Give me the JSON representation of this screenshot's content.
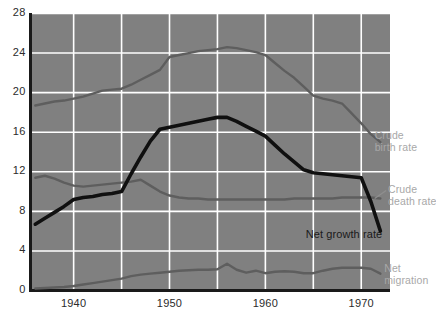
{
  "chart_data": {
    "type": "line",
    "title": "",
    "xlabel": "",
    "ylabel": "",
    "xlim": [
      1935.5,
      1973.0
    ],
    "ylim": [
      0,
      28
    ],
    "grid": true,
    "legend_position": "inline-right-of-lines",
    "x_ticks": [
      "1940",
      "1950",
      "1960",
      "1970"
    ],
    "x_tick_values": [
      1940,
      1950,
      1960,
      1970
    ],
    "x_gridlines": [
      1940,
      1945,
      1950,
      1955,
      1960,
      1965,
      1970
    ],
    "y_ticks": [
      "0",
      "4",
      "8",
      "12",
      "16",
      "20",
      "24",
      "28"
    ],
    "y_tick_values": [
      0,
      4,
      8,
      12,
      16,
      20,
      24,
      28
    ],
    "background_color": "#808080",
    "gridline_color": "#ffffff",
    "axis_color": "#1a1a1a",
    "series": [
      {
        "name": "Crude birth rate",
        "color": "#5e5e5e",
        "width": 2.4,
        "label_position": "right",
        "x": [
          1936,
          1937,
          1938,
          1939,
          1940,
          1941,
          1942,
          1943,
          1944,
          1945,
          1946,
          1947,
          1948,
          1949,
          1950,
          1951,
          1952,
          1953,
          1954,
          1955,
          1956,
          1957,
          1958,
          1959,
          1960,
          1961,
          1962,
          1963,
          1964,
          1965,
          1966,
          1967,
          1968,
          1969,
          1970,
          1971,
          1972
        ],
        "values": [
          18.7,
          18.9,
          19.1,
          19.2,
          19.4,
          19.6,
          19.9,
          20.2,
          20.3,
          20.4,
          20.8,
          21.3,
          21.8,
          22.3,
          23.6,
          23.8,
          24.0,
          24.2,
          24.3,
          24.4,
          24.6,
          24.5,
          24.3,
          24.1,
          23.8,
          23.0,
          22.2,
          21.5,
          20.6,
          19.7,
          19.4,
          19.2,
          18.9,
          17.9,
          16.9,
          15.8,
          15.0
        ],
        "start_value": 18.7,
        "peak_value": 24.6,
        "peak_x": 1956,
        "end_value": 15.0
      },
      {
        "name": "Crude death rate",
        "color": "#5e5e5e",
        "width": 2.4,
        "label_position": "right",
        "x": [
          1936,
          1937,
          1938,
          1939,
          1940,
          1941,
          1942,
          1943,
          1944,
          1945,
          1946,
          1947,
          1948,
          1949,
          1950,
          1951,
          1952,
          1953,
          1954,
          1955,
          1956,
          1957,
          1958,
          1959,
          1960,
          1961,
          1962,
          1963,
          1964,
          1965,
          1966,
          1967,
          1968,
          1969,
          1970,
          1971,
          1972
        ],
        "values": [
          11.4,
          11.6,
          11.3,
          10.9,
          10.6,
          10.5,
          10.6,
          10.7,
          10.8,
          10.9,
          11.0,
          11.2,
          10.6,
          10.0,
          9.6,
          9.4,
          9.3,
          9.3,
          9.2,
          9.2,
          9.2,
          9.2,
          9.2,
          9.2,
          9.2,
          9.2,
          9.2,
          9.3,
          9.3,
          9.3,
          9.3,
          9.3,
          9.4,
          9.4,
          9.4,
          9.4,
          9.3
        ],
        "start_value": 11.4,
        "end_value": 9.3
      },
      {
        "name": "Net growth rate",
        "color": "#101010",
        "width": 3.6,
        "label_position": "below-right",
        "x": [
          1936,
          1937,
          1938,
          1939,
          1940,
          1941,
          1942,
          1943,
          1944,
          1945,
          1946,
          1947,
          1948,
          1949,
          1950,
          1951,
          1952,
          1953,
          1954,
          1955,
          1956,
          1957,
          1958,
          1959,
          1960,
          1961,
          1962,
          1963,
          1964,
          1965,
          1966,
          1967,
          1968,
          1969,
          1970,
          1971,
          1972
        ],
        "values": [
          6.7,
          7.3,
          7.9,
          8.5,
          9.2,
          9.4,
          9.5,
          9.7,
          9.8,
          10.0,
          11.8,
          13.5,
          15.1,
          16.3,
          16.5,
          16.7,
          16.9,
          17.1,
          17.3,
          17.5,
          17.5,
          17.1,
          16.6,
          16.1,
          15.6,
          14.7,
          13.8,
          13.0,
          12.2,
          11.9,
          11.8,
          11.7,
          11.6,
          11.5,
          11.4,
          9.0,
          6.0
        ],
        "start_value": 6.7,
        "peak_value": 17.5,
        "peak_x": 1956,
        "end_value": 6.0
      },
      {
        "name": "Net migration",
        "color": "#5e5e5e",
        "width": 2.4,
        "label_position": "right",
        "x": [
          1936,
          1937,
          1938,
          1939,
          1940,
          1941,
          1942,
          1943,
          1944,
          1945,
          1946,
          1947,
          1948,
          1949,
          1950,
          1951,
          1952,
          1953,
          1954,
          1955,
          1956,
          1957,
          1958,
          1959,
          1960,
          1961,
          1962,
          1963,
          1964,
          1965,
          1966,
          1967,
          1968,
          1969,
          1970,
          1971,
          1972
        ],
        "values": [
          0.2,
          0.25,
          0.3,
          0.35,
          0.45,
          0.6,
          0.75,
          0.9,
          1.05,
          1.2,
          1.45,
          1.6,
          1.7,
          1.8,
          1.9,
          2.0,
          2.05,
          2.1,
          2.1,
          2.15,
          2.7,
          2.1,
          1.8,
          2.0,
          1.75,
          1.9,
          1.95,
          1.9,
          1.75,
          1.75,
          2.0,
          2.2,
          2.3,
          2.3,
          2.3,
          2.2,
          1.7
        ],
        "start_value": 0.2,
        "end_value": 1.7
      }
    ],
    "annotations": [
      {
        "text": "Crude birth rate",
        "color": "#a8a8a8"
      },
      {
        "text": "Crude death rate",
        "color": "#a8a8a8"
      },
      {
        "text": "Net growth rate",
        "color": "#1a1a1a"
      },
      {
        "text": "Net migration",
        "color": "#a8a8a8"
      }
    ]
  },
  "labels": {
    "crude_birth_rate_line1": "Crude",
    "crude_birth_rate_line2": "birth rate",
    "crude_death_rate_line1": "Crude",
    "crude_death_rate_line2": "death rate",
    "net_growth_rate": "Net growth rate",
    "net_migration_line1": "Net",
    "net_migration_line2": "migration"
  }
}
